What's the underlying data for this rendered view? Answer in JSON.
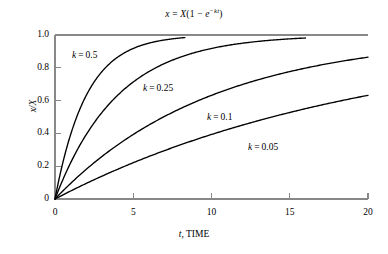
{
  "chart_data": {
    "type": "line",
    "title_parts": {
      "lhs": "x",
      "equals": "=",
      "amplitude": "X",
      "open_paren": "(",
      "one": "1",
      "minus": "−",
      "base": "e",
      "exp_minus": "−",
      "exp_rate": "k",
      "exp_time": "t",
      "close_paren": ")"
    },
    "xlabel": "t, TIME",
    "xlabel_parts": {
      "var": "t",
      "rest": ", TIME"
    },
    "ylabel": "x/X",
    "xlim": [
      0,
      20
    ],
    "ylim": [
      0,
      1.0
    ],
    "xticks": [
      "0",
      "5",
      "10",
      "15",
      "20"
    ],
    "xtick_values": [
      0,
      5,
      10,
      15,
      20
    ],
    "yticks": [
      "0",
      "0.2",
      "0.4",
      "0.6",
      "0.8",
      "1.0"
    ],
    "ytick_values": [
      0,
      0.2,
      0.4,
      0.6,
      0.8,
      1.0
    ],
    "grid": false,
    "legend": "inline-annotations",
    "curve_color": "#000000",
    "axis_color": "#888888",
    "series": [
      {
        "name": "k = 0.5",
        "k": 0.5,
        "label_parts": {
          "var": "k",
          "eq": "=",
          "val": "0.5"
        },
        "t_start": 0,
        "t_end": 8.3,
        "y_end": 0.984,
        "label_x": 72,
        "label_y": 50
      },
      {
        "name": "k = 0.25",
        "k": 0.25,
        "label_parts": {
          "var": "k",
          "eq": "=",
          "val": "0.25"
        },
        "t_start": 0,
        "t_end": 16.0,
        "y_end": 0.982,
        "label_x": 143,
        "label_y": 83
      },
      {
        "name": "k = 0.1",
        "k": 0.1,
        "label_parts": {
          "var": "k",
          "eq": "=",
          "val": "0.1"
        },
        "t_start": 0,
        "t_end": 20.0,
        "y_end": 0.865,
        "label_x": 207,
        "label_y": 112
      },
      {
        "name": "k = 0.05",
        "k": 0.05,
        "label_parts": {
          "var": "k",
          "eq": "=",
          "val": "0.05"
        },
        "t_start": 0,
        "t_end": 20.0,
        "y_end": 0.632,
        "label_x": 248,
        "label_y": 142
      }
    ],
    "plot_box": {
      "left": 55,
      "right": 368,
      "top": 35,
      "bottom": 199
    }
  }
}
